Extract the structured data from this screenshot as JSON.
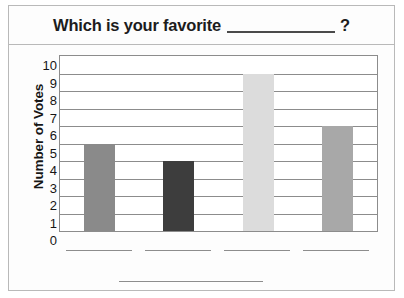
{
  "worksheet": {
    "question_prefix": "Which is your favorite",
    "question_blank": "",
    "question_suffix": "?"
  },
  "chart_data": {
    "type": "bar",
    "xlabel": "",
    "ylabel": "Number of Votes",
    "categories": [
      "",
      "",
      "",
      ""
    ],
    "values": [
      5,
      4,
      9,
      6
    ],
    "ylim": [
      0,
      10
    ],
    "yticks": [
      10,
      9,
      8,
      7,
      6,
      5,
      4,
      3,
      2,
      1,
      0
    ],
    "ytick_labels": [
      "10",
      "9",
      "8",
      "7",
      "6",
      "5",
      "4",
      "3",
      "2",
      "1",
      "0"
    ],
    "grid": true,
    "legend": "none",
    "bar_colors": [
      "#8a8a8a",
      "#3d3d3d",
      "#dcdcdc",
      "#a8a8a8"
    ],
    "bar_border_color": "#8c8c8c"
  },
  "colors": {
    "frame": "#b9b9b9",
    "axis": "#8c8c8c",
    "blank_line": "#8d8d8d",
    "text": "#161616"
  }
}
